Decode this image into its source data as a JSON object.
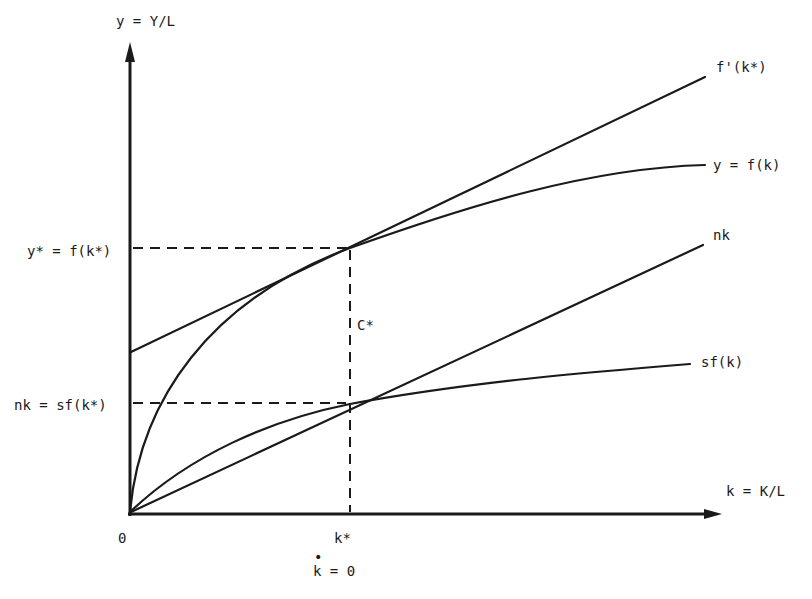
{
  "diagram": {
    "y_axis_label": "y = Y/L",
    "x_axis_label": "k = K/L",
    "origin_label": "0",
    "k_star_label": "k*",
    "k_dot_label": "k = 0",
    "k_dot_mark": "•",
    "y_star_label": "y* = f(k*)",
    "nk_level_label": "nk = sf(k*)",
    "c_star_label": "C*",
    "curves": {
      "tangent": "f'(k*)",
      "production": "y = f(k)",
      "depreciation": "nk",
      "savings": "sf(k)"
    },
    "colors": {
      "ink": "#1a1a1a",
      "background": "#ffffff"
    }
  }
}
